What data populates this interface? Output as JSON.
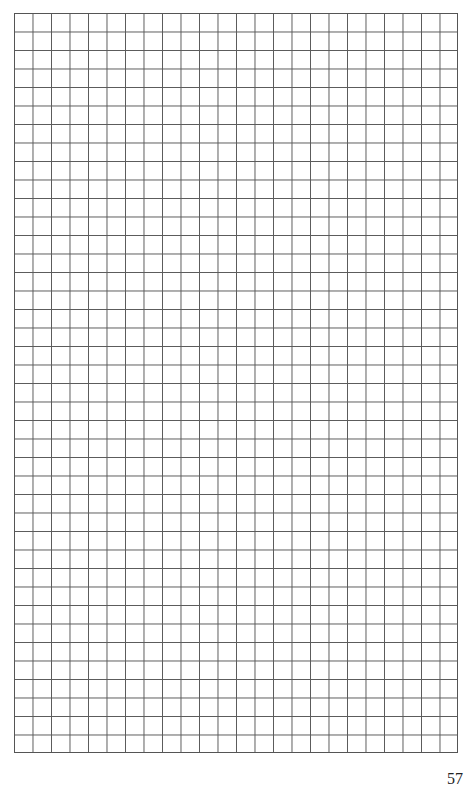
{
  "page": {
    "type": "graph-paper",
    "grid": {
      "columns": 24,
      "rows": 40,
      "line_color": "#5a5a5a",
      "background_color": "#ffffff"
    },
    "page_number": "57"
  }
}
